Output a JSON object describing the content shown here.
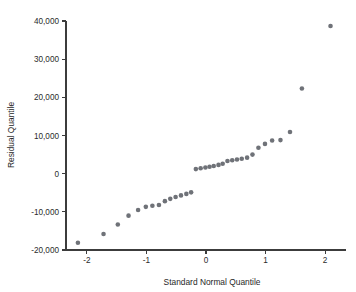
{
  "chart_data": {
    "type": "scatter",
    "title": "",
    "xlabel": "Standard Normal Quantile",
    "ylabel": "Residual Quantile",
    "xlim": [
      -2.35,
      2.35
    ],
    "ylim": [
      -20000,
      40000
    ],
    "grid": false,
    "legend": null,
    "marker_color": "#6f7278",
    "marker_size": 2.3,
    "xticks": [
      -2,
      -1,
      0,
      1,
      2
    ],
    "xtick_labels": [
      "-2",
      "-1",
      "0",
      "1",
      "2"
    ],
    "yticks": [
      -20000,
      -10000,
      0,
      10000,
      20000,
      30000,
      40000
    ],
    "ytick_labels": [
      "-20,000",
      "-10,000",
      "0",
      "10,000",
      "20,000",
      "30,000",
      "40,000"
    ],
    "series": [
      {
        "name": "residual quantiles",
        "x": [
          -2.15,
          -1.72,
          -1.48,
          -1.3,
          -1.14,
          -1.01,
          -0.9,
          -0.79,
          -0.69,
          -0.6,
          -0.51,
          -0.42,
          -0.33,
          -0.25,
          -0.17,
          -0.09,
          -0.01,
          0.06,
          0.13,
          0.21,
          0.28,
          0.36,
          0.44,
          0.52,
          0.6,
          0.69,
          0.78,
          0.88,
          0.99,
          1.11,
          1.25,
          1.41,
          1.61,
          2.09
        ],
        "y": [
          -18100,
          -15800,
          -13300,
          -11000,
          -9500,
          -8700,
          -8400,
          -8200,
          -7200,
          -6600,
          -6100,
          -5700,
          -5300,
          -4900,
          1200,
          1400,
          1600,
          1800,
          2000,
          2300,
          2600,
          3300,
          3500,
          3700,
          3900,
          4200,
          5000,
          6800,
          7800,
          8700,
          8800,
          10900,
          22300,
          38700
        ]
      }
    ]
  },
  "axes": {
    "x_label": "Standard Normal Quantile",
    "y_label": "Residual Quantile"
  }
}
